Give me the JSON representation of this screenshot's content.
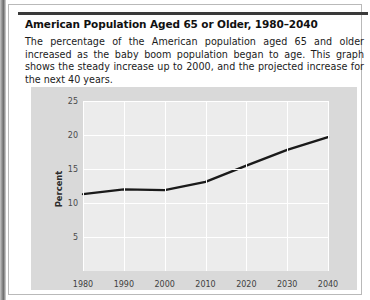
{
  "figure": {
    "title": "American Population Aged 65 or Older, 1980–2040",
    "caption": "The percentage of the American population aged 65 and older increased as the baby boom population began to age. This graph shows the steady increase up to 2000, and the projected increase for the next 40 years."
  },
  "colors": {
    "line": "#1a1a1a",
    "panel_background": "#d9d9d9",
    "plot_background": "#ececec",
    "gridline": "#ffffff",
    "text": "#1b1b1b",
    "rule": "#3a3a3a"
  },
  "chart_data": {
    "type": "line",
    "title": "American Population Aged 65 or Older, 1980–2040",
    "xlabel": "",
    "ylabel": "Percent",
    "x": [
      1980,
      1990,
      2000,
      2010,
      2020,
      2030,
      2040
    ],
    "values": [
      11.3,
      12.0,
      11.9,
      13.1,
      15.5,
      17.8,
      19.7
    ],
    "series": [
      {
        "name": "Percent of American population aged 65 or older",
        "values": [
          11.3,
          12.0,
          11.9,
          13.1,
          15.5,
          17.8,
          19.7
        ]
      }
    ],
    "xtick_labels": [
      "1980",
      "1990",
      "2000",
      "2010",
      "2020",
      "2030",
      "2040"
    ],
    "ytick_labels": [
      "5",
      "10",
      "15",
      "20",
      "25"
    ],
    "yticks": [
      5,
      10,
      15,
      20,
      25
    ],
    "xlim": [
      1980,
      2040
    ],
    "ylim": [
      0,
      25
    ],
    "grid": true,
    "legend": "none"
  }
}
